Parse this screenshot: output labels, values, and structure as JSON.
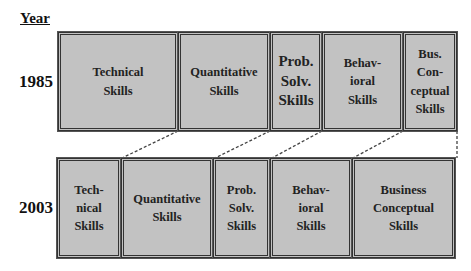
{
  "header": {
    "year_label": "Year"
  },
  "rows": [
    {
      "year": "1985",
      "boxes": [
        {
          "label": "Technical\nSkills"
        },
        {
          "label": "Quantitative\nSkills"
        },
        {
          "label": "Prob.\nSolv.\nSkills"
        },
        {
          "label": "Behav-\nioral\nSkills"
        },
        {
          "label": "Bus.\nCon-\nceptual\nSkills"
        }
      ]
    },
    {
      "year": "2003",
      "boxes": [
        {
          "label": "Tech-\nnical\nSkills"
        },
        {
          "label": "Quantitative\nSkills"
        },
        {
          "label": "Prob.\nSolv.\nSkills"
        },
        {
          "label": "Behav-\nioral\nSkills"
        },
        {
          "label": "Business\nConceptual\nSkills"
        }
      ]
    }
  ],
  "colors": {
    "box_fill": "#c2c2c2",
    "border": "#333333"
  }
}
